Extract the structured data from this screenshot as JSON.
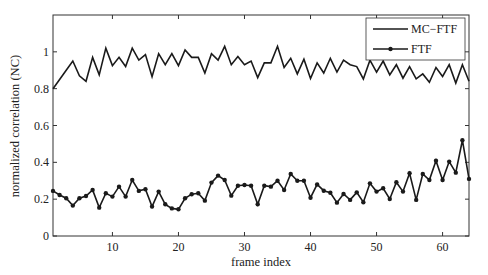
{
  "chart_data": {
    "type": "line",
    "title": "",
    "xlabel": "frame index",
    "ylabel": "normalized correlation (NC)",
    "xlim": [
      1,
      64
    ],
    "ylim": [
      0,
      1.2
    ],
    "xticks": [
      10,
      20,
      30,
      40,
      50,
      60
    ],
    "yticks": [
      0,
      0.2,
      0.4,
      0.6,
      0.8,
      1
    ],
    "ytick_labels": [
      "0",
      "0.2",
      "0.4",
      "0.6",
      "0.8",
      "1"
    ],
    "grid": false,
    "legend_position": "upper right",
    "x": [
      1,
      2,
      3,
      4,
      5,
      6,
      7,
      8,
      9,
      10,
      11,
      12,
      13,
      14,
      15,
      16,
      17,
      18,
      19,
      20,
      21,
      22,
      23,
      24,
      25,
      26,
      27,
      28,
      29,
      30,
      31,
      32,
      33,
      34,
      35,
      36,
      37,
      38,
      39,
      40,
      41,
      42,
      43,
      44,
      45,
      46,
      47,
      48,
      49,
      50,
      51,
      52,
      53,
      54,
      55,
      56,
      57,
      58,
      59,
      60,
      61,
      62,
      63,
      64
    ],
    "series": [
      {
        "name": "MC−FTF",
        "marker": "none",
        "color": "#1a1a1a",
        "values": [
          0.8,
          0.85,
          0.9,
          0.95,
          0.87,
          0.84,
          0.97,
          0.875,
          1.02,
          0.925,
          0.97,
          0.92,
          1.02,
          0.955,
          0.985,
          0.865,
          0.99,
          0.93,
          0.99,
          0.925,
          1.01,
          0.97,
          0.97,
          0.885,
          0.99,
          0.955,
          1.03,
          0.93,
          0.975,
          0.93,
          0.95,
          0.86,
          0.94,
          0.94,
          1.03,
          0.915,
          0.965,
          0.88,
          0.96,
          0.855,
          0.94,
          0.885,
          0.965,
          0.89,
          0.955,
          0.93,
          0.92,
          0.853,
          0.955,
          0.89,
          0.95,
          0.875,
          0.93,
          0.857,
          0.92,
          0.853,
          0.88,
          0.835,
          0.915,
          0.866,
          0.93,
          0.83,
          0.93,
          0.84
        ]
      },
      {
        "name": "FTF",
        "marker": "dot",
        "color": "#1a1a1a",
        "values": [
          0.245,
          0.223,
          0.205,
          0.165,
          0.205,
          0.217,
          0.25,
          0.154,
          0.232,
          0.214,
          0.268,
          0.214,
          0.304,
          0.245,
          0.254,
          0.16,
          0.241,
          0.172,
          0.15,
          0.145,
          0.205,
          0.227,
          0.232,
          0.192,
          0.29,
          0.328,
          0.304,
          0.219,
          0.273,
          0.277,
          0.273,
          0.172,
          0.273,
          0.268,
          0.3,
          0.25,
          0.337,
          0.3,
          0.3,
          0.208,
          0.28,
          0.246,
          0.235,
          0.181,
          0.228,
          0.196,
          0.237,
          0.183,
          0.286,
          0.241,
          0.259,
          0.201,
          0.292,
          0.241,
          0.341,
          0.196,
          0.337,
          0.304,
          0.409,
          0.304,
          0.404,
          0.344,
          0.52,
          0.31
        ]
      }
    ]
  },
  "legend": {
    "items": [
      {
        "label": "MC−FTF"
      },
      {
        "label": "FTF"
      }
    ]
  }
}
